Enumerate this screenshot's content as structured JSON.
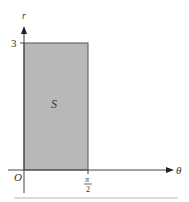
{
  "diagram": {
    "type": "rectangle-region-in-theta-r-plane",
    "axes": {
      "horizontal_label": "θ",
      "vertical_label": "r",
      "origin_label": "O"
    },
    "ticks": {
      "r_tick": "3",
      "theta_tick_numerator": "π",
      "theta_tick_denominator": "2"
    },
    "region": {
      "label": "S",
      "theta_range": [
        "0",
        "π/2"
      ],
      "r_range": [
        "0",
        "3"
      ],
      "fill_color": "#b8b8b8",
      "border_color": "#555555"
    },
    "colors": {
      "axis": "#444444",
      "text": "#333333",
      "footer_rule": "#cfcfcf"
    }
  }
}
